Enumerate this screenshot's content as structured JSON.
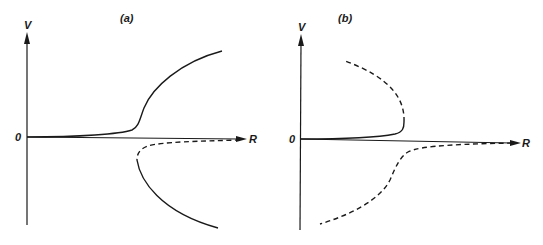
{
  "figure": {
    "panels": [
      {
        "label": "(a)",
        "y_axis_label": "V",
        "x_axis_label": "R",
        "origin_label": "0",
        "curves": [
          {
            "name": "upper-stable-branch",
            "style": "solid",
            "description": "starts near origin along R axis, rises sharply then bends to large positive V"
          },
          {
            "name": "lower-unstable-branch",
            "style": "dashed",
            "description": "from far R just below axis back toward fold point"
          },
          {
            "name": "lower-stable-branch",
            "style": "solid",
            "description": "from fold point curving down to large negative V"
          }
        ]
      },
      {
        "label": "(b)",
        "y_axis_label": "V",
        "x_axis_label": "R",
        "origin_label": "0",
        "curves": [
          {
            "name": "upper-stable-branch",
            "style": "solid",
            "description": "starts near origin along R axis to fold point"
          },
          {
            "name": "upper-unstable-branch",
            "style": "dashed",
            "description": "from fold point curving back up and left to positive V"
          },
          {
            "name": "lower-unstable-branch",
            "style": "dashed",
            "description": "from far R just below axis, descending sigmoidally to large negative V"
          }
        ]
      }
    ]
  }
}
